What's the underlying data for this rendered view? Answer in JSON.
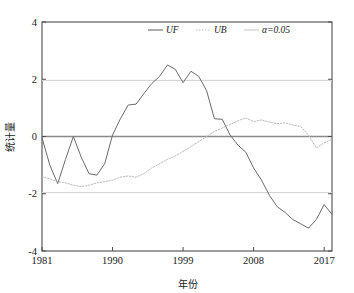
{
  "chart_data": {
    "type": "line",
    "title": "",
    "xlabel": "年份",
    "ylabel": "统计量",
    "xlim": [
      1981,
      2018
    ],
    "ylim": [
      -4,
      4
    ],
    "xticks": [
      1981,
      1990,
      1999,
      2008,
      2017
    ],
    "xtick_labels": [
      "1981",
      "1990",
      "1999",
      "2008",
      "2017"
    ],
    "yticks": [
      -4,
      -2,
      0,
      2,
      4
    ],
    "ytick_labels": [
      "-4",
      "-2",
      "0",
      "2",
      "4"
    ],
    "grid": false,
    "legend_position": "top-center",
    "legend": [
      {
        "name": "UF",
        "style": "solid",
        "color": "#6b6b6b"
      },
      {
        "name": "UB",
        "style": "dotted",
        "color": "#b9b9b9"
      },
      {
        "name": "α=0.05",
        "style": "solid",
        "color": "#c9c9c9"
      }
    ],
    "annotations": [
      {
        "label": "critical upper",
        "y": 1.96
      },
      {
        "label": "critical lower",
        "y": -1.96
      },
      {
        "label": "zero line",
        "y": 0
      }
    ],
    "x": [
      1981,
      1982,
      1983,
      1984,
      1985,
      1986,
      1987,
      1988,
      1989,
      1990,
      1991,
      1992,
      1993,
      1994,
      1995,
      1996,
      1997,
      1998,
      1999,
      2000,
      2001,
      2002,
      2003,
      2004,
      2005,
      2006,
      2007,
      2008,
      2009,
      2010,
      2011,
      2012,
      2013,
      2014,
      2015,
      2016,
      2017,
      2018
    ],
    "series": [
      {
        "name": "UF",
        "style": "solid",
        "color": "#6b6b6b",
        "values": [
          -0.05,
          -1.0,
          -1.65,
          -0.8,
          0.0,
          -0.72,
          -1.3,
          -1.35,
          -0.95,
          0.05,
          0.62,
          1.1,
          1.13,
          1.5,
          1.85,
          2.1,
          2.5,
          2.35,
          1.88,
          2.28,
          2.1,
          1.6,
          0.62,
          0.6,
          0.05,
          -0.3,
          -0.55,
          -1.1,
          -1.52,
          -2.05,
          -2.45,
          -2.65,
          -2.9,
          -3.05,
          -3.2,
          -2.9,
          -2.38,
          -2.72
        ]
      },
      {
        "name": "UB",
        "style": "dotted",
        "color": "#b9b9b9",
        "values": [
          -1.4,
          -1.48,
          -1.58,
          -1.62,
          -1.7,
          -1.75,
          -1.7,
          -1.62,
          -1.58,
          -1.52,
          -1.42,
          -1.38,
          -1.42,
          -1.3,
          -1.1,
          -0.95,
          -0.8,
          -0.68,
          -0.52,
          -0.35,
          -0.18,
          0.0,
          0.18,
          0.3,
          0.42,
          0.55,
          0.65,
          0.52,
          0.58,
          0.5,
          0.45,
          0.48,
          0.4,
          0.35,
          0.05,
          -0.4,
          -0.22,
          -0.1
        ]
      }
    ]
  },
  "axis": {
    "y_label": "统计量",
    "x_label": "年份"
  }
}
